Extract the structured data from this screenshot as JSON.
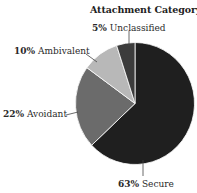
{
  "chart_data": {
    "type": "pie",
    "title": "Attachment Category",
    "categories": [
      "Secure",
      "Avoidant",
      "Ambivalent",
      "Unclassified"
    ],
    "values": [
      63,
      22,
      10,
      5
    ],
    "unit": "%",
    "colors": [
      "#1f1f1f",
      "#6b6b6b",
      "#b8b8b8",
      "#3c3c3c"
    ],
    "start_angle": "12 o'clock, clockwise",
    "legend": "none (direct labels with leader lines)"
  },
  "labels": {
    "secure": {
      "pct": "63%",
      "name": "Secure"
    },
    "avoidant": {
      "pct": "22%",
      "name": "Avoidant"
    },
    "ambivalent": {
      "pct": "10%",
      "name": "Ambivalent"
    },
    "unclassified": {
      "pct": "5%",
      "name": "Unclassified"
    }
  }
}
